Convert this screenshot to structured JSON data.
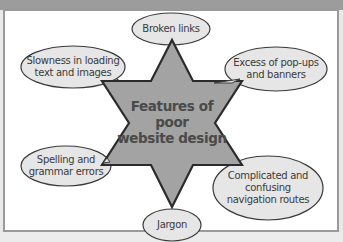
{
  "diagram": {
    "center": {
      "line1": "Features of",
      "line2": "poor",
      "line3": "website design"
    },
    "nodes": [
      {
        "id": "broken-links",
        "lines": [
          "Broken links"
        ]
      },
      {
        "id": "slowness",
        "lines": [
          "Slowness in loading",
          "text and images"
        ]
      },
      {
        "id": "popups",
        "lines": [
          "Excess of pop-ups",
          "and banners"
        ]
      },
      {
        "id": "spelling",
        "lines": [
          "Spelling and",
          "grammar errors"
        ]
      },
      {
        "id": "navigation",
        "lines": [
          "Complicated and",
          "confusing",
          "navigation routes"
        ]
      },
      {
        "id": "jargon",
        "lines": [
          "Jargon"
        ]
      }
    ],
    "colors": {
      "star_fill": "#a3a3a3",
      "star_stroke": "#2b2b2b",
      "bubble_fill": "#e6e6e6",
      "bubble_stroke": "#3a3a3a",
      "frame": "#9a9a9a"
    }
  }
}
